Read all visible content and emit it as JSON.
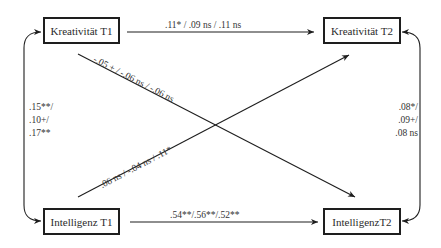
{
  "diagram": {
    "nodes": {
      "kreativitaet_t1": "Kreativität T1",
      "kreativitaet_t2": "Kreativität T2",
      "intelligenz_t1": "Intelligenz T1",
      "intelligenz_t2": "IntelligenzT2"
    },
    "paths": {
      "k1_to_k2": ".11* / .09 ns / .11 ns",
      "i1_to_i2": ".54**/.56**/.52**",
      "k1_to_i2": "-.05 + / -.06 ns / -.06 ns",
      "i1_to_k2": ".06 ns / -.04 ns / .11*"
    },
    "correlations": {
      "t1": [
        ".15**/",
        ".10+/",
        ".17**"
      ],
      "t2": [
        ".08*/",
        ".09+/",
        ".08 ns"
      ]
    },
    "colors": {
      "line": "#1e1e1e",
      "text": "#333333",
      "background": "#ffffff"
    }
  }
}
